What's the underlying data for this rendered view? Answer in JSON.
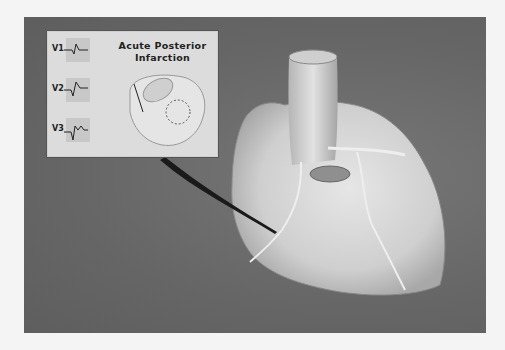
{
  "inset": {
    "title_line1": "Acute Posterior",
    "title_line2": "Infarction",
    "leads": [
      "V1",
      "V2",
      "V3"
    ]
  },
  "colors": {
    "background": "#f4f4f4",
    "panel": "#6a6a6a",
    "inset": "#dcdcdc"
  }
}
